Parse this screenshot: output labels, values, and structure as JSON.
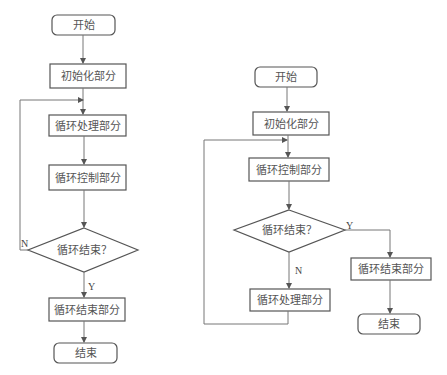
{
  "colors": {
    "background": "#ffffff",
    "stroke": "#555555",
    "edge": "#777777",
    "text": "#555555"
  },
  "left_flowchart": {
    "start": "开始",
    "init": "初始化部分",
    "process": "循环处理部分",
    "control": "循环控制部分",
    "decision": "循环结束？",
    "no_label": "N",
    "yes_label": "Y",
    "finish_part": "循环结束部分",
    "end": "结束"
  },
  "right_flowchart": {
    "start": "开始",
    "init": "初始化部分",
    "control": "循环控制部分",
    "decision": "循环结束？",
    "yes_label": "Y",
    "no_label": "N",
    "finish_part": "循环结束部分",
    "process": "循环处理部分",
    "end": "结束"
  }
}
